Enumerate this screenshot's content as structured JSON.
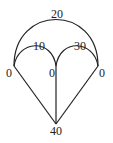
{
  "diagram": {
    "type": "graph",
    "nodes": [
      {
        "id": "left",
        "label": "0"
      },
      {
        "id": "center",
        "label": "0"
      },
      {
        "id": "right",
        "label": "0"
      },
      {
        "id": "bottom",
        "label": "40"
      }
    ],
    "edges": [
      {
        "from": "left",
        "to": "right",
        "shape": "arc",
        "label": "20"
      },
      {
        "from": "left",
        "to": "center",
        "shape": "arc",
        "label": "10"
      },
      {
        "from": "center",
        "to": "right",
        "shape": "arc",
        "label": "30"
      },
      {
        "from": "left",
        "to": "bottom",
        "shape": "line",
        "label": ""
      },
      {
        "from": "center",
        "to": "bottom",
        "shape": "line",
        "label": ""
      },
      {
        "from": "right",
        "to": "bottom",
        "shape": "line",
        "label": ""
      }
    ]
  }
}
